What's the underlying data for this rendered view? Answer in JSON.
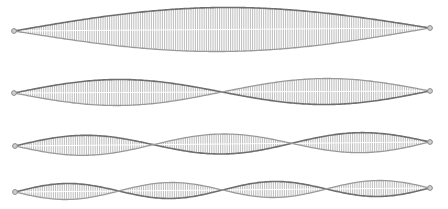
{
  "diagram": {
    "type": "standing-wave-harmonics",
    "colors": {
      "background": "#ffffff",
      "envelope_stroke": "#6e6e6e",
      "envelope_stroke_light": "#9a9a9a",
      "hatch": "#b4b4b4",
      "center_line": "#ffffff",
      "endpoint": "#8a8a8a"
    },
    "waves": [
      {
        "harmonic": 1,
        "x_start": 14,
        "x_end": 430,
        "y_start": 31,
        "y_end": 28,
        "amplitude": 22
      },
      {
        "harmonic": 2,
        "x_start": 14,
        "x_end": 430,
        "y_start": 93,
        "y_end": 91,
        "amplitude": 13
      },
      {
        "harmonic": 3,
        "x_start": 15,
        "x_end": 430,
        "y_start": 146,
        "y_end": 142,
        "amplitude": 10
      },
      {
        "harmonic": 4,
        "x_start": 15,
        "x_end": 430,
        "y_start": 192,
        "y_end": 188,
        "amplitude": 8
      }
    ]
  }
}
